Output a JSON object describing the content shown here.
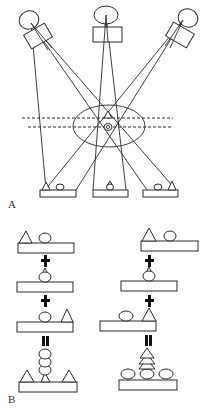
{
  "figure": {
    "panel_a": {
      "label": "A",
      "description": "Three X-ray source/detector projections through an elliptical object containing a triangle and a circle",
      "sources": [
        "left",
        "center",
        "right"
      ],
      "object_contents": [
        "triangle",
        "circle"
      ],
      "detectors": [
        {
          "position": "left",
          "shapes_order": [
            "triangle",
            "circle"
          ]
        },
        {
          "position": "center",
          "shapes_order": [
            "triangle-on-circle"
          ]
        },
        {
          "position": "right",
          "shapes_order": [
            "circle",
            "triangle"
          ]
        }
      ]
    },
    "panel_b": {
      "label": "B",
      "description": "Back-projection summation of the three projections",
      "operators": {
        "plus": "+",
        "equals": "="
      },
      "columns": [
        {
          "name": "left-column",
          "rows": [
            {
              "shapes": [
                "triangle",
                "circle"
              ]
            },
            {
              "shapes": [
                "triangle-on-circle"
              ]
            },
            {
              "shapes": [
                "circle",
                "triangle"
              ]
            }
          ],
          "result": {
            "shapes": [
              "triangle",
              "stacked-circles",
              "triangle"
            ]
          }
        },
        {
          "name": "right-column",
          "rows": [
            {
              "shapes": [
                "triangle",
                "circle"
              ]
            },
            {
              "shapes": [
                "triangle-on-circle"
              ]
            },
            {
              "shapes": [
                "circle",
                "triangle"
              ]
            }
          ],
          "result": {
            "shapes": [
              "circle",
              "stacked-triangles-on-circle",
              "circle"
            ]
          }
        }
      ]
    }
  }
}
